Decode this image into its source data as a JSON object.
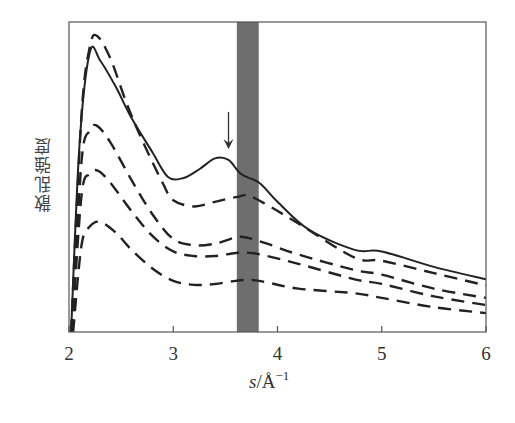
{
  "chart_data": {
    "type": "line",
    "title": "",
    "xlabel": "s/Å⁻¹",
    "xlabel_parts": {
      "var": "s",
      "unit": "/Å",
      "exp": "−1"
    },
    "ylabel": "散乱強度",
    "xlim": [
      2,
      6
    ],
    "ylim": [
      0,
      100
    ],
    "x_ticks": [
      2,
      3,
      4,
      5,
      6
    ],
    "y_ticks": [],
    "grid": false,
    "legend": null,
    "annotations": [
      {
        "type": "arrow",
        "x": 3.53,
        "y_from": 71,
        "y_to": 59,
        "direction": "down",
        "note": "local peak of solid curve"
      },
      {
        "type": "shaded_band",
        "x_from": 3.61,
        "x_to": 3.82,
        "color": "#6e6e6e"
      }
    ],
    "series": [
      {
        "name": "solid",
        "style": "solid",
        "color": "#222222",
        "x": [
          2.02,
          2.1,
          2.2,
          2.3,
          2.45,
          2.6,
          2.8,
          2.95,
          3.1,
          3.25,
          3.4,
          3.53,
          3.65,
          3.83,
          4.0,
          4.3,
          4.74,
          5.0,
          5.5,
          6.0
        ],
        "y": [
          0,
          60,
          90.3,
          87.5,
          79,
          69,
          58,
          50,
          49.7,
          52.5,
          56,
          55.5,
          51,
          48,
          42,
          33,
          26.5,
          26,
          21,
          17
        ]
      },
      {
        "name": "dashed-1",
        "style": "dashed",
        "color": "#222222",
        "x": [
          2.02,
          2.12,
          2.2,
          2.27,
          2.4,
          2.55,
          2.7,
          2.9,
          3.0,
          3.2,
          3.4,
          3.6,
          3.72,
          3.9,
          4.2,
          4.74,
          5.0,
          5.5,
          6.0
        ],
        "y": [
          0,
          70,
          92,
          95.5,
          88,
          74,
          62,
          48,
          42.5,
          40.5,
          42,
          43.5,
          44,
          41,
          35,
          24,
          23,
          19,
          15
        ]
      },
      {
        "name": "dashed-2",
        "style": "dashed",
        "color": "#222222",
        "x": [
          2.03,
          2.12,
          2.2,
          2.27,
          2.4,
          2.6,
          2.8,
          3.0,
          3.2,
          3.4,
          3.6,
          3.7,
          3.9,
          4.2,
          4.74,
          5.0,
          5.5,
          6.0
        ],
        "y": [
          0,
          55,
          65,
          66.5,
          61,
          49,
          38,
          30,
          28,
          28.5,
          30.5,
          30.5,
          28.5,
          25,
          20,
          18.5,
          14,
          11
        ]
      },
      {
        "name": "dashed-3",
        "style": "dashed",
        "color": "#222222",
        "x": [
          2.03,
          2.12,
          2.2,
          2.28,
          2.4,
          2.6,
          2.8,
          3.0,
          3.2,
          3.4,
          3.6,
          3.75,
          3.9,
          4.2,
          4.74,
          5.0,
          5.5,
          6.0
        ],
        "y": [
          0,
          44,
          51,
          52,
          48,
          39,
          31,
          26,
          24.5,
          24.5,
          25.5,
          25.5,
          24.5,
          22,
          17,
          15.5,
          11.5,
          8.7
        ]
      },
      {
        "name": "dashed-4",
        "style": "dashed",
        "color": "#222222",
        "x": [
          2.04,
          2.12,
          2.2,
          2.3,
          2.45,
          2.6,
          2.8,
          3.0,
          3.2,
          3.4,
          3.6,
          3.75,
          3.9,
          4.2,
          4.74,
          5.0,
          5.5,
          6.0
        ],
        "y": [
          0,
          28,
          34,
          35.5,
          32,
          26.5,
          20.5,
          16.5,
          15.2,
          15.5,
          16.5,
          16.8,
          16,
          14,
          12.5,
          11,
          8,
          6.1
        ]
      }
    ]
  }
}
